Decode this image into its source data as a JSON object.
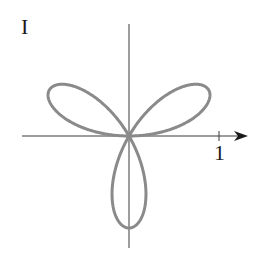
{
  "panel": {
    "label": "I"
  },
  "colors": {
    "axis": "#3a3a3a",
    "curve": "#8a8a8a",
    "background": "#ffffff"
  },
  "chart_data": {
    "type": "line",
    "title": "I",
    "equation": "r = sin(3θ)",
    "petals": 3,
    "petal_directions_deg": [
      30,
      150,
      270
    ],
    "xlabel": "",
    "ylabel": "",
    "x_ticks": [
      1
    ],
    "x_tick_labels": [
      "1"
    ],
    "xlim": [
      -1.2,
      1.3
    ],
    "ylim": [
      -1.25,
      1.25
    ],
    "grid": false,
    "legend": null
  },
  "layout": {
    "origin_px": [
      129,
      136
    ],
    "unit_px": 92
  }
}
